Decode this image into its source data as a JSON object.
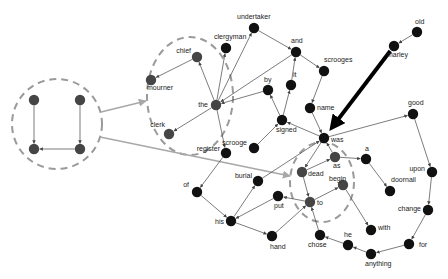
{
  "diagram": {
    "type": "word-network",
    "colors": {
      "node_black": "#111111",
      "node_gray": "#454545",
      "edge": "#444444",
      "highlight_edge": "#a8a8a8",
      "cluster_outline": "#9a9a9a",
      "bold_arrow": "#000000"
    },
    "nodes": [
      {
        "id": "l1",
        "label": "",
        "x": 34,
        "y": 100,
        "color": "gray"
      },
      {
        "id": "l2",
        "label": "",
        "x": 80,
        "y": 100,
        "color": "gray"
      },
      {
        "id": "l3",
        "label": "",
        "x": 34,
        "y": 149,
        "color": "gray"
      },
      {
        "id": "l4",
        "label": "",
        "x": 80,
        "y": 149,
        "color": "gray"
      },
      {
        "id": "chief",
        "label": "chief",
        "x": 197,
        "y": 57,
        "color": "gray"
      },
      {
        "id": "mourner",
        "label": "mourner",
        "x": 151,
        "y": 80,
        "color": "gray"
      },
      {
        "id": "clerk",
        "label": "clerk",
        "x": 169,
        "y": 134,
        "color": "gray"
      },
      {
        "id": "the",
        "label": "the",
        "x": 216,
        "y": 105,
        "color": "gray"
      },
      {
        "id": "clergyman",
        "label": "clergyman",
        "x": 226,
        "y": 48,
        "color": "black"
      },
      {
        "id": "undertaker",
        "label": "undertaker",
        "x": 254,
        "y": 28,
        "color": "black"
      },
      {
        "id": "and",
        "label": "and",
        "x": 296,
        "y": 52,
        "color": "black"
      },
      {
        "id": "it",
        "label": "it",
        "x": 291,
        "y": 85,
        "color": "black"
      },
      {
        "id": "by",
        "label": "by",
        "x": 268,
        "y": 90,
        "color": "black"
      },
      {
        "id": "scrooges",
        "label": "scrooges",
        "x": 324,
        "y": 71,
        "color": "black"
      },
      {
        "id": "name",
        "label": "name",
        "x": 310,
        "y": 108,
        "color": "black"
      },
      {
        "id": "signed",
        "label": "signed",
        "x": 282,
        "y": 120,
        "color": "black"
      },
      {
        "id": "scrooge",
        "label": "scrooge",
        "x": 254,
        "y": 148,
        "color": "black"
      },
      {
        "id": "register",
        "label": "register",
        "x": 226,
        "y": 153,
        "color": "black"
      },
      {
        "id": "was",
        "label": "was",
        "x": 324,
        "y": 138,
        "color": "black"
      },
      {
        "id": "as",
        "label": "as",
        "x": 335,
        "y": 157,
        "color": "gray"
      },
      {
        "id": "a",
        "label": "a",
        "x": 366,
        "y": 159,
        "color": "black"
      },
      {
        "id": "dead",
        "label": "dead",
        "x": 302,
        "y": 172,
        "color": "gray"
      },
      {
        "id": "begin",
        "label": "begin",
        "x": 343,
        "y": 185,
        "color": "gray"
      },
      {
        "id": "to",
        "label": "to",
        "x": 310,
        "y": 202,
        "color": "gray"
      },
      {
        "id": "doornail",
        "label": "doornail",
        "x": 390,
        "y": 191,
        "color": "black"
      },
      {
        "id": "with",
        "label": "with",
        "x": 371,
        "y": 230,
        "color": "black"
      },
      {
        "id": "chose",
        "label": "chose",
        "x": 320,
        "y": 235,
        "color": "black"
      },
      {
        "id": "he",
        "label": "he",
        "x": 348,
        "y": 245,
        "color": "black"
      },
      {
        "id": "good",
        "label": "good",
        "x": 413,
        "y": 114,
        "color": "black"
      },
      {
        "id": "upon",
        "label": "upon",
        "x": 432,
        "y": 172,
        "color": "black"
      },
      {
        "id": "change",
        "label": "change",
        "x": 428,
        "y": 210,
        "color": "black"
      },
      {
        "id": "for",
        "label": "for",
        "x": 409,
        "y": 244,
        "color": "black"
      },
      {
        "id": "anything",
        "label": "anything",
        "x": 371,
        "y": 254,
        "color": "black"
      },
      {
        "id": "of",
        "label": "of",
        "x": 197,
        "y": 192,
        "color": "black"
      },
      {
        "id": "burial",
        "label": "burial",
        "x": 258,
        "y": 181,
        "color": "black"
      },
      {
        "id": "put",
        "label": "put",
        "x": 278,
        "y": 196,
        "color": "black"
      },
      {
        "id": "his",
        "label": "his",
        "x": 231,
        "y": 221,
        "color": "black"
      },
      {
        "id": "hand",
        "label": "hand",
        "x": 272,
        "y": 236,
        "color": "black"
      },
      {
        "id": "old",
        "label": "old",
        "x": 417,
        "y": 32,
        "color": "black"
      },
      {
        "id": "marley",
        "label": "marley",
        "x": 394,
        "y": 46,
        "color": "black"
      }
    ],
    "edges": [
      {
        "from": "l1",
        "to": "l3"
      },
      {
        "from": "l2",
        "to": "l4"
      },
      {
        "from": "l4",
        "to": "l3"
      },
      {
        "from": "chief",
        "to": "mourner"
      },
      {
        "from": "the",
        "to": "chief"
      },
      {
        "from": "the",
        "to": "clerk"
      },
      {
        "from": "the",
        "to": "clergyman"
      },
      {
        "from": "the",
        "to": "undertaker"
      },
      {
        "from": "undertaker",
        "to": "and"
      },
      {
        "from": "and",
        "to": "the"
      },
      {
        "from": "by",
        "to": "the"
      },
      {
        "from": "and",
        "to": "scrooges"
      },
      {
        "from": "scrooges",
        "to": "name"
      },
      {
        "from": "name",
        "to": "was"
      },
      {
        "from": "signed",
        "to": "it"
      },
      {
        "from": "it",
        "to": "and"
      },
      {
        "from": "signed",
        "to": "by"
      },
      {
        "from": "scrooge",
        "to": "signed"
      },
      {
        "from": "was",
        "to": "signed"
      },
      {
        "from": "the",
        "to": "register"
      },
      {
        "from": "register",
        "to": "of"
      },
      {
        "from": "of",
        "to": "his"
      },
      {
        "from": "his",
        "to": "burial"
      },
      {
        "from": "put",
        "to": "his"
      },
      {
        "from": "his",
        "to": "hand"
      },
      {
        "from": "hand",
        "to": "to"
      },
      {
        "from": "to",
        "to": "put"
      },
      {
        "from": "was",
        "to": "good"
      },
      {
        "from": "good",
        "to": "upon"
      },
      {
        "from": "upon",
        "to": "change"
      },
      {
        "from": "change",
        "to": "for"
      },
      {
        "from": "for",
        "to": "anything"
      },
      {
        "from": "anything",
        "to": "he"
      },
      {
        "from": "he",
        "to": "chose"
      },
      {
        "from": "chose",
        "to": "to"
      },
      {
        "from": "was",
        "to": "dead"
      },
      {
        "from": "as",
        "to": "was"
      },
      {
        "from": "dead",
        "to": "as"
      },
      {
        "from": "as",
        "to": "a"
      },
      {
        "from": "a",
        "to": "doornail"
      },
      {
        "from": "dead",
        "to": "to"
      },
      {
        "from": "to",
        "to": "begin"
      },
      {
        "from": "begin",
        "to": "with"
      },
      {
        "from": "burial",
        "to": "was"
      },
      {
        "from": "old",
        "to": "marley"
      }
    ],
    "bold_arrow": {
      "from": "marley",
      "to": "was"
    },
    "clusters": [
      {
        "id": "left-cluster",
        "cx": 57,
        "cy": 124,
        "rx": 45,
        "ry": 45
      },
      {
        "id": "the-cluster",
        "cx": 190,
        "cy": 96,
        "rx": 43,
        "ry": 59
      },
      {
        "id": "was-cluster",
        "cx": 322,
        "cy": 182,
        "rx": 32,
        "ry": 40
      }
    ],
    "highlight_edges": [
      {
        "from_x": 101,
        "from_y": 112,
        "to_x": 146,
        "to_y": 101
      },
      {
        "from_x": 100,
        "from_y": 137,
        "to_x": 290,
        "to_y": 176
      }
    ]
  }
}
